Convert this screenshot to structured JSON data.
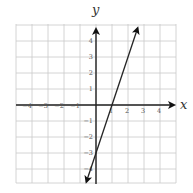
{
  "chart_data": {
    "type": "line",
    "title": "",
    "xlabel": "x",
    "ylabel": "y",
    "xlim": [
      -5,
      5
    ],
    "ylim": [
      -5,
      5
    ],
    "grid": true,
    "x_tick_labels": [
      "-4",
      "-3",
      "-2",
      "-1",
      "1",
      "2",
      "3",
      "4"
    ],
    "y_tick_labels": [
      "4",
      "3",
      "2",
      "1",
      "-1",
      "-2",
      "-3",
      "-4"
    ],
    "series": [
      {
        "name": "line",
        "equation": "y = 3x - 3",
        "slope": 3,
        "intercept": -3,
        "x": [
          -0.6,
          0,
          1,
          2,
          2.6
        ],
        "y": [
          -4.8,
          -3,
          0,
          3,
          4.8
        ],
        "arrows_both_ends": true,
        "color": "#222222"
      }
    ]
  },
  "labels": {
    "x_axis": "x",
    "y_axis": "y"
  }
}
